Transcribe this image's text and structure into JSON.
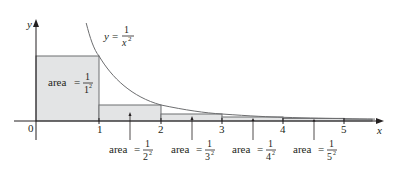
{
  "figure": {
    "type": "area-under-curve",
    "curve_label": {
      "lhs": "y",
      "eq": "=",
      "num": "1",
      "den": "x",
      "exp": "2"
    },
    "axes": {
      "x_label": "x",
      "y_label": "y",
      "origin_label": "0",
      "x_ticks": [
        "1",
        "2",
        "3",
        "4",
        "5"
      ]
    },
    "rectangles": [
      {
        "label": "area",
        "eq": "=",
        "num": "1",
        "den": "1",
        "exp": "2"
      },
      {
        "label": "area",
        "eq": "=",
        "num": "1",
        "den": "2",
        "exp": "2"
      },
      {
        "label": "area",
        "eq": "=",
        "num": "1",
        "den": "3",
        "exp": "2"
      },
      {
        "label": "area",
        "eq": "=",
        "num": "1",
        "den": "4",
        "exp": "2"
      },
      {
        "label": "area",
        "eq": "=",
        "num": "1",
        "den": "5",
        "exp": "2"
      }
    ],
    "colors": {
      "fill": "#e3e4e5",
      "stroke": "#6d6e70",
      "axis": "#231f20",
      "text": "#231f20"
    }
  }
}
